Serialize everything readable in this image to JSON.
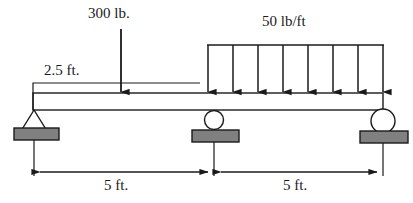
{
  "figure": {
    "kind": "beam-free-body-diagram"
  },
  "labels": {
    "point_load": "300 lb.",
    "distributed_load": "50 lb/ft",
    "overhang": "2.5 ft.",
    "span_left": "5 ft.",
    "span_right": "5 ft."
  },
  "colors": {
    "line": "#1a1a1a",
    "support_fill": "#808080",
    "background": "#ffffff",
    "beam_fill": "#ffffff"
  },
  "geometry": {
    "beam": {
      "x1": 33,
      "x2": 383,
      "top": 93,
      "bottom": 110
    },
    "supports": [
      {
        "type": "pin",
        "x": 34,
        "plate_x": 14,
        "plate_y": 128,
        "plate_w": 45,
        "plate_h": 12
      },
      {
        "type": "roller",
        "x": 214,
        "radius": 9,
        "plate_x": 192,
        "plate_y": 131,
        "plate_w": 47,
        "plate_h": 12
      },
      {
        "type": "roller",
        "x": 383,
        "radius": 12,
        "plate_x": 360,
        "plate_y": 131,
        "plate_w": 48,
        "plate_h": 12
      }
    ],
    "point_load_arrow": {
      "x": 121,
      "y_top": 29,
      "y_bottom": 93
    },
    "distributed_load": {
      "x_start": 208,
      "x_end": 383,
      "y_top": 45,
      "y_bottom": 93,
      "arrow_count": 8
    },
    "dimension_line_y": 172,
    "dimension_ticks": [
      34,
      214,
      383
    ]
  }
}
